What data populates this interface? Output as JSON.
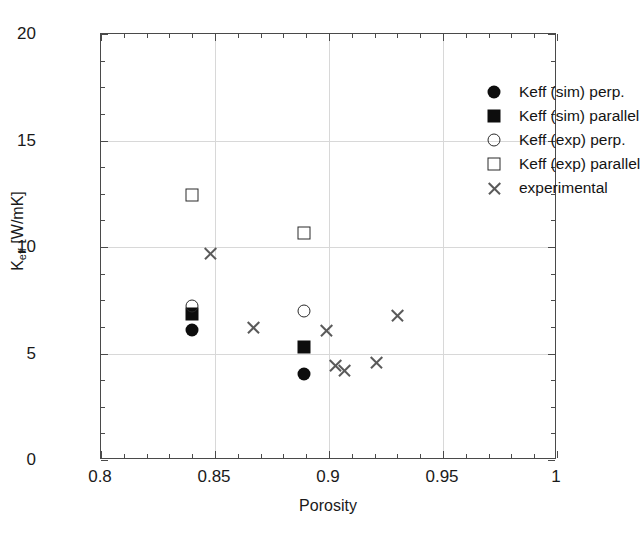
{
  "chart": {
    "type": "scatter",
    "title": "",
    "xlabel": "Porosity",
    "ylabel_main": "K",
    "ylabel_sub": "eff",
    "ylabel_unit": " [W/mK]",
    "ylabel_full": "Keff [W/mK]",
    "xlim": [
      0.8,
      1.0
    ],
    "ylim": [
      0,
      20
    ],
    "xticks": [
      "0.8",
      "0.85",
      "0.9",
      "0.95",
      "1"
    ],
    "xtick_values": [
      0.8,
      0.85,
      0.9,
      0.95,
      1.0
    ],
    "yticks": [
      "0",
      "5",
      "10",
      "15",
      "20"
    ],
    "ytick_values": [
      0,
      5,
      10,
      15,
      20
    ],
    "grid": "major-both-faint",
    "legend_position": "top-right-inside"
  },
  "chart_data": {
    "type": "scatter",
    "title": "",
    "xlabel": "Porosity",
    "ylabel": "Keff [W/mK]",
    "xlim": [
      0.8,
      1.0
    ],
    "ylim": [
      0,
      20
    ],
    "xticks": [
      0.8,
      0.85,
      0.9,
      0.95,
      1.0
    ],
    "yticks": [
      0,
      5,
      10,
      15,
      20
    ],
    "grid": true,
    "legend_position": "upper right",
    "series": [
      {
        "name": "Keff (sim) perp.",
        "marker": "filled-circle",
        "color": "#0d0d0d",
        "points": [
          {
            "x": 0.84,
            "y": 6.1
          },
          {
            "x": 0.889,
            "y": 4.05
          }
        ]
      },
      {
        "name": "Keff (sim) parallel",
        "marker": "filled-square",
        "color": "#0d0d0d",
        "points": [
          {
            "x": 0.84,
            "y": 6.85
          },
          {
            "x": 0.889,
            "y": 5.3
          }
        ]
      },
      {
        "name": "Keff (exp) perp.",
        "marker": "open-circle",
        "color": "#2a2a2a",
        "points": [
          {
            "x": 0.84,
            "y": 7.25
          },
          {
            "x": 0.889,
            "y": 7.0
          }
        ]
      },
      {
        "name": "Keff (exp) parallel",
        "marker": "open-square",
        "color": "#2a2a2a",
        "points": [
          {
            "x": 0.84,
            "y": 12.45
          },
          {
            "x": 0.889,
            "y": 10.65
          }
        ]
      },
      {
        "name": "experimental",
        "marker": "cross",
        "color": "#5a5a5a",
        "points": [
          {
            "x": 0.848,
            "y": 9.7
          },
          {
            "x": 0.867,
            "y": 6.2
          },
          {
            "x": 0.899,
            "y": 6.1
          },
          {
            "x": 0.903,
            "y": 4.45
          },
          {
            "x": 0.907,
            "y": 4.2
          },
          {
            "x": 0.921,
            "y": 4.6
          },
          {
            "x": 0.93,
            "y": 6.8
          }
        ]
      }
    ]
  },
  "legend": {
    "entries": [
      {
        "label": "Keff (sim) perp.",
        "marker": "filled-circle"
      },
      {
        "label": "Keff (sim) parallel",
        "marker": "filled-square"
      },
      {
        "label": "Keff (exp) perp.",
        "marker": "open-circle"
      },
      {
        "label": "Keff (exp) parallel",
        "marker": "open-square"
      },
      {
        "label": "experimental",
        "marker": "cross"
      }
    ]
  }
}
